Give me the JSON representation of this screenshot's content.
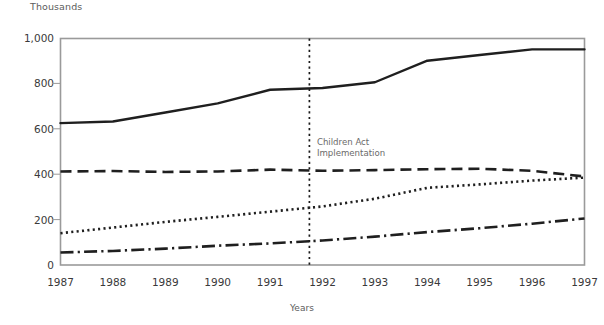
{
  "chart_data": {
    "type": "line",
    "title": "",
    "subtitle": "",
    "unit_label": "Thousands",
    "xlabel": "Years",
    "ylabel": "",
    "grid": false,
    "legend": "none",
    "x": [
      1987,
      1988,
      1989,
      1990,
      1991,
      1992,
      1993,
      1994,
      1995,
      1996,
      1997
    ],
    "xlim": [
      1987,
      1997
    ],
    "ylim": [
      0,
      1000
    ],
    "ytick_values": [
      0,
      200,
      400,
      600,
      800,
      1000
    ],
    "ytick_labels": [
      "0",
      "200",
      "400",
      "600",
      "800",
      "1,000"
    ],
    "xtick_labels": [
      "1987",
      "1988",
      "1989",
      "1990",
      "1991",
      "1992",
      "1993",
      "1994",
      "1995",
      "1996",
      "1997"
    ],
    "series": [
      {
        "name": "series-solid",
        "style": "solid",
        "color": "#1f1f1f",
        "values": [
          625,
          632,
          672,
          712,
          772,
          780,
          805,
          900,
          925,
          950,
          950
        ]
      },
      {
        "name": "series-dashed",
        "style": "dashed",
        "color": "#1f1f1f",
        "values": [
          412,
          414,
          410,
          412,
          420,
          415,
          418,
          422,
          424,
          415,
          390
        ]
      },
      {
        "name": "series-dotted",
        "style": "dotted",
        "color": "#1f1f1f",
        "values": [
          140,
          165,
          190,
          212,
          235,
          258,
          292,
          340,
          355,
          372,
          385
        ]
      },
      {
        "name": "series-dash-dot",
        "style": "dash-dot",
        "color": "#1f1f1f",
        "values": [
          55,
          62,
          72,
          85,
          95,
          108,
          125,
          145,
          162,
          182,
          205
        ]
      }
    ],
    "annotations": [
      {
        "name": "children-act-implementation",
        "text": "Children Act\nImplementation",
        "x_value": 1991.75,
        "y_value": 530,
        "vline": true,
        "vline_style": "dotted",
        "vline_color": "#1a1a1a"
      }
    ],
    "colors": {
      "axis": "#9a9a9a",
      "line": "#1f1f1f",
      "tick_text": "#3a3a3a",
      "label_text": "#5c5c5c",
      "annotation_text": "#6a6a6a",
      "background": "#ffffff"
    }
  }
}
